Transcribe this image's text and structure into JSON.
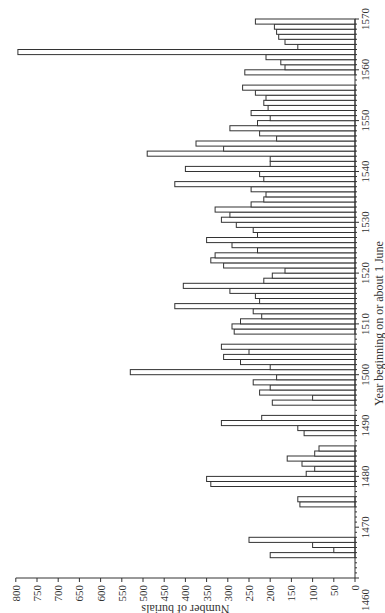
{
  "chart_data": {
    "type": "bar",
    "orientation": "horizontal (figure rotated 90°: years along vertical axis, burials along horizontal axis increasing leftward)",
    "title": "",
    "xlabel": "Year beginning on or about 1 June",
    "ylabel": "Number of burials",
    "year_range": [
      1460,
      1570
    ],
    "value_range": [
      0,
      800
    ],
    "year_ticks_major": [
      1460,
      1470,
      1480,
      1490,
      1500,
      1510,
      1520,
      1530,
      1540,
      1550,
      1560,
      1570
    ],
    "value_ticks": [
      0,
      50,
      100,
      150,
      200,
      250,
      300,
      350,
      400,
      450,
      500,
      550,
      600,
      650,
      700,
      750,
      800
    ],
    "grid": false,
    "legend": null,
    "data": [
      {
        "year": 1464,
        "burials": 200
      },
      {
        "year": 1465,
        "burials": 50
      },
      {
        "year": 1466,
        "burials": 100
      },
      {
        "year": 1467,
        "burials": 250
      },
      {
        "year": 1474,
        "burials": 130
      },
      {
        "year": 1475,
        "burials": 135
      },
      {
        "year": 1478,
        "burials": 340
      },
      {
        "year": 1479,
        "burials": 350
      },
      {
        "year": 1480,
        "burials": 115
      },
      {
        "year": 1481,
        "burials": 95
      },
      {
        "year": 1482,
        "burials": 125
      },
      {
        "year": 1483,
        "burials": 160
      },
      {
        "year": 1484,
        "burials": 95
      },
      {
        "year": 1485,
        "burials": 85
      },
      {
        "year": 1488,
        "burials": 120
      },
      {
        "year": 1489,
        "burials": 135
      },
      {
        "year": 1490,
        "burials": 315
      },
      {
        "year": 1491,
        "burials": 220
      },
      {
        "year": 1494,
        "burials": 195
      },
      {
        "year": 1495,
        "burials": 100
      },
      {
        "year": 1496,
        "burials": 225
      },
      {
        "year": 1497,
        "burials": 200
      },
      {
        "year": 1498,
        "burials": 240
      },
      {
        "year": 1499,
        "burials": 185
      },
      {
        "year": 1500,
        "burials": 530
      },
      {
        "year": 1501,
        "burials": 200
      },
      {
        "year": 1502,
        "burials": 270
      },
      {
        "year": 1503,
        "burials": 310
      },
      {
        "year": 1504,
        "burials": 250
      },
      {
        "year": 1505,
        "burials": 315
      },
      {
        "year": 1508,
        "burials": 285
      },
      {
        "year": 1509,
        "burials": 290
      },
      {
        "year": 1510,
        "burials": 270
      },
      {
        "year": 1511,
        "burials": 220
      },
      {
        "year": 1512,
        "burials": 240
      },
      {
        "year": 1513,
        "burials": 425
      },
      {
        "year": 1514,
        "burials": 225
      },
      {
        "year": 1515,
        "burials": 235
      },
      {
        "year": 1516,
        "burials": 295
      },
      {
        "year": 1517,
        "burials": 405
      },
      {
        "year": 1518,
        "burials": 215
      },
      {
        "year": 1519,
        "burials": 195
      },
      {
        "year": 1520,
        "burials": 165
      },
      {
        "year": 1521,
        "burials": 310
      },
      {
        "year": 1522,
        "burials": 340
      },
      {
        "year": 1523,
        "burials": 330
      },
      {
        "year": 1524,
        "burials": 230
      },
      {
        "year": 1525,
        "burials": 290
      },
      {
        "year": 1526,
        "burials": 350
      },
      {
        "year": 1527,
        "burials": 230
      },
      {
        "year": 1528,
        "burials": 240
      },
      {
        "year": 1529,
        "burials": 280
      },
      {
        "year": 1530,
        "burials": 315
      },
      {
        "year": 1531,
        "burials": 295
      },
      {
        "year": 1532,
        "burials": 330
      },
      {
        "year": 1533,
        "burials": 245
      },
      {
        "year": 1534,
        "burials": 215
      },
      {
        "year": 1535,
        "burials": 210
      },
      {
        "year": 1536,
        "burials": 245
      },
      {
        "year": 1537,
        "burials": 425
      },
      {
        "year": 1538,
        "burials": 215
      },
      {
        "year": 1539,
        "burials": 225
      },
      {
        "year": 1540,
        "burials": 400
      },
      {
        "year": 1541,
        "burials": 200
      },
      {
        "year": 1542,
        "burials": 200
      },
      {
        "year": 1543,
        "burials": 490
      },
      {
        "year": 1544,
        "burials": 310
      },
      {
        "year": 1545,
        "burials": 375
      },
      {
        "year": 1546,
        "burials": 185
      },
      {
        "year": 1547,
        "burials": 225
      },
      {
        "year": 1548,
        "burials": 295
      },
      {
        "year": 1549,
        "burials": 230
      },
      {
        "year": 1550,
        "burials": 200
      },
      {
        "year": 1551,
        "burials": 245
      },
      {
        "year": 1552,
        "burials": 205
      },
      {
        "year": 1553,
        "burials": 215
      },
      {
        "year": 1554,
        "burials": 210
      },
      {
        "year": 1555,
        "burials": 235
      },
      {
        "year": 1556,
        "burials": 265
      },
      {
        "year": 1559,
        "burials": 260
      },
      {
        "year": 1560,
        "burials": 165
      },
      {
        "year": 1561,
        "burials": 175
      },
      {
        "year": 1562,
        "burials": 210
      },
      {
        "year": 1563,
        "burials": 795
      },
      {
        "year": 1564,
        "burials": 135
      },
      {
        "year": 1565,
        "burials": 165
      },
      {
        "year": 1566,
        "burials": 180
      },
      {
        "year": 1567,
        "burials": 185
      },
      {
        "year": 1568,
        "burials": 190
      },
      {
        "year": 1569,
        "burials": 235
      }
    ]
  }
}
